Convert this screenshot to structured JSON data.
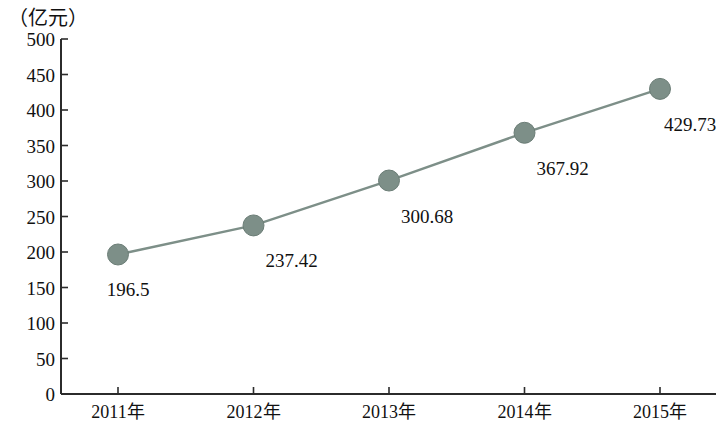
{
  "chart_data": {
    "type": "line",
    "title": "",
    "subtitle": "",
    "xlabel": "",
    "ylabel": "（亿元）",
    "unit_label": "（亿元）",
    "categories": [
      "2011年",
      "2012年",
      "2013年",
      "2014年",
      "2015年"
    ],
    "values": [
      196.5,
      237.42,
      300.68,
      367.92,
      429.73
    ],
    "point_labels": [
      "196.5",
      "237.42",
      "300.68",
      "367.92",
      "429.73"
    ],
    "series": [
      {
        "name": "",
        "values": [
          196.5,
          237.42,
          300.68,
          367.92,
          429.73
        ]
      }
    ],
    "ylim": [
      0,
      500
    ],
    "ytick_step": 50,
    "ytick_labels": [
      "500",
      "450",
      "400",
      "350",
      "300",
      "250",
      "200",
      "150",
      "100",
      "50",
      "0"
    ],
    "ytick_values": [
      500,
      450,
      400,
      350,
      300,
      250,
      200,
      150,
      100,
      50,
      0
    ],
    "grid": false,
    "legend": false,
    "legend_position": "none",
    "marker": "circle",
    "colors": {
      "line": "#7d8f88",
      "marker": "#7d8f88",
      "marker_edge": "#6b7d76",
      "axis": "#2b2b2b",
      "text": "#111111",
      "background": "#ffffff"
    }
  }
}
